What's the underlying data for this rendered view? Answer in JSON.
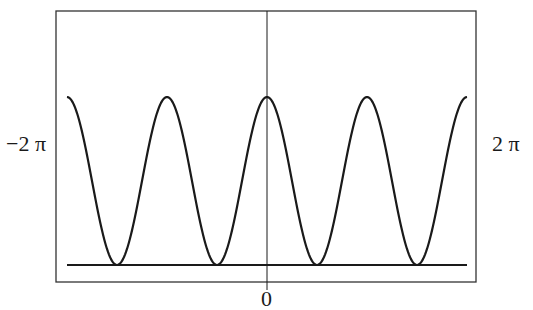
{
  "chart_data": {
    "type": "line",
    "title": "",
    "xlabel": "",
    "ylabel": "",
    "xlim": [
      "-2π",
      "2π"
    ],
    "x_tick_labels": [
      "-2 π",
      "0",
      "2 π"
    ],
    "grid": false,
    "legend": null,
    "function_shape": "periodic cosine-like wave, period π, maxima at x = -2π, -π, 0, π, 2π and minima touching baseline at x = -3π/2, -π/2, π/2, 3π/2",
    "series": [
      {
        "name": "curve",
        "x": [
          "-2π",
          "-3π/2",
          "-π",
          "-π/2",
          "0",
          "π/2",
          "π",
          "3π/2",
          "2π"
        ],
        "values": [
          1,
          0,
          1,
          0,
          1,
          0,
          1,
          0,
          1
        ]
      }
    ],
    "baseline": 0,
    "vertical_axis_at": "0"
  },
  "labels": {
    "left": "−2 π",
    "right": "2 π",
    "bottom": "0"
  },
  "colors": {
    "line": "#1a1a1a",
    "frame": "#333333",
    "background": "#ffffff"
  }
}
